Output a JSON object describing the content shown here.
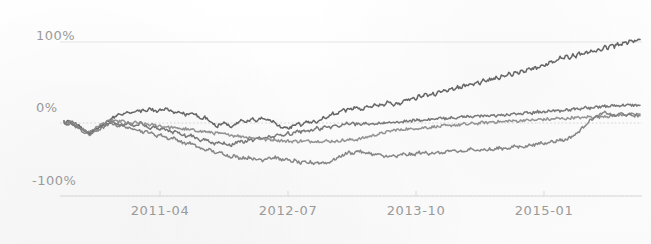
{
  "chart_data": {
    "type": "line",
    "title": "",
    "subtitle": "",
    "xlabel": "",
    "ylabel": "",
    "grid": true,
    "legend_position": "none",
    "ylim": [
      -100,
      100
    ],
    "ytick_labels": [
      "100%",
      "0%",
      "-100%"
    ],
    "ytick_values": [
      100,
      0,
      -100
    ],
    "xtick_labels": [
      "2011-04",
      "2012-07",
      "2013-10",
      "2015-01"
    ],
    "xtick_index": [
      30,
      70,
      110,
      150
    ],
    "x_count": 181,
    "x_domain_note": "monthly-like index from 2010-01 to 2015-04",
    "colors": {
      "series_1": "#595959",
      "series_2": "#6e6e6e",
      "series_3": "#8a8a8a",
      "series_4": "#7d7d7d",
      "gridline": "#e2e2e2",
      "zero_gridline": "#cfcfcf",
      "axis": "#d8d8d8",
      "tick_text": "#9a9a9a",
      "background": "#fdfdfd"
    },
    "series": [
      {
        "name": "series_1",
        "color": "#595959",
        "final_value": 103,
        "values": [
          2,
          1,
          3,
          0,
          -2,
          -4,
          -7,
          -10,
          -12,
          -9,
          -6,
          -4,
          -2,
          1,
          3,
          6,
          8,
          11,
          9,
          12,
          14,
          11,
          13,
          16,
          14,
          17,
          15,
          18,
          16,
          14,
          17,
          15,
          18,
          16,
          14,
          12,
          15,
          13,
          10,
          12,
          14,
          11,
          8,
          5,
          7,
          4,
          1,
          -2,
          -4,
          -1,
          1,
          -2,
          -5,
          -3,
          0,
          2,
          4,
          1,
          3,
          5,
          2,
          4,
          6,
          3,
          5,
          2,
          0,
          -3,
          -6,
          -4,
          -7,
          -5,
          -2,
          0,
          -3,
          -1,
          2,
          0,
          3,
          1,
          4,
          7,
          5,
          9,
          12,
          10,
          14,
          17,
          15,
          19,
          16,
          20,
          18,
          16,
          19,
          21,
          18,
          22,
          20,
          24,
          22,
          26,
          24,
          21,
          25,
          23,
          27,
          30,
          28,
          32,
          30,
          34,
          32,
          36,
          33,
          37,
          35,
          39,
          37,
          41,
          39,
          43,
          41,
          45,
          43,
          47,
          45,
          49,
          47,
          51,
          49,
          53,
          51,
          55,
          53,
          57,
          55,
          59,
          57,
          61,
          59,
          63,
          61,
          65,
          63,
          67,
          65,
          69,
          67,
          71,
          69,
          73,
          76,
          74,
          78,
          81,
          79,
          83,
          80,
          84,
          82,
          86,
          84,
          88,
          86,
          90,
          88,
          92,
          90,
          94,
          92,
          96,
          94,
          98,
          96,
          100,
          98,
          102,
          100,
          103,
          103
        ]
      },
      {
        "name": "series_2",
        "color": "#6e6e6e",
        "final_value": 22,
        "values": [
          0,
          -1,
          1,
          -2,
          -4,
          -6,
          -9,
          -11,
          -13,
          -10,
          -8,
          -6,
          -4,
          -2,
          0,
          2,
          0,
          -2,
          -4,
          -2,
          0,
          -2,
          -4,
          -2,
          0,
          -2,
          -4,
          -6,
          -4,
          -6,
          -8,
          -6,
          -8,
          -10,
          -12,
          -10,
          -12,
          -14,
          -16,
          -14,
          -16,
          -18,
          -20,
          -22,
          -20,
          -22,
          -24,
          -26,
          -24,
          -26,
          -24,
          -26,
          -28,
          -26,
          -24,
          -22,
          -24,
          -22,
          -20,
          -22,
          -20,
          -18,
          -20,
          -18,
          -16,
          -18,
          -16,
          -14,
          -16,
          -14,
          -12,
          -14,
          -12,
          -10,
          -12,
          -10,
          -8,
          -10,
          -8,
          -6,
          -8,
          -6,
          -4,
          -6,
          -4,
          -2,
          -4,
          -2,
          0,
          -2,
          0,
          -2,
          0,
          -2,
          0,
          -1,
          0,
          -1,
          0,
          -1,
          0,
          1,
          0,
          1,
          2,
          1,
          2,
          3,
          2,
          3,
          4,
          3,
          4,
          5,
          4,
          5,
          6,
          5,
          6,
          5,
          6,
          7,
          6,
          7,
          8,
          7,
          8,
          7,
          8,
          9,
          8,
          9,
          8,
          9,
          10,
          9,
          10,
          9,
          10,
          11,
          10,
          11,
          12,
          11,
          12,
          13,
          12,
          13,
          14,
          13,
          14,
          15,
          14,
          15,
          16,
          15,
          16,
          17,
          16,
          17,
          18,
          17,
          18,
          19,
          18,
          19,
          20,
          19,
          20,
          21,
          20,
          21,
          22,
          21,
          22,
          22,
          22,
          22,
          22,
          22,
          22
        ]
      },
      {
        "name": "series_3",
        "color": "#8a8a8a",
        "final_value": 11,
        "values": [
          1,
          0,
          2,
          -1,
          -3,
          -5,
          -8,
          -10,
          -11,
          -8,
          -6,
          -3,
          -1,
          1,
          2,
          4,
          2,
          1,
          3,
          1,
          0,
          -1,
          1,
          0,
          -1,
          -2,
          -1,
          -3,
          -2,
          -4,
          -3,
          -5,
          -4,
          -6,
          -5,
          -7,
          -6,
          -8,
          -7,
          -9,
          -8,
          -10,
          -9,
          -11,
          -10,
          -12,
          -11,
          -13,
          -12,
          -14,
          -13,
          -15,
          -14,
          -16,
          -15,
          -17,
          -16,
          -18,
          -17,
          -19,
          -18,
          -20,
          -19,
          -21,
          -20,
          -21,
          -20,
          -22,
          -21,
          -23,
          -22,
          -23,
          -22,
          -23,
          -22,
          -23,
          -22,
          -23,
          -22,
          -23,
          -22,
          -23,
          -22,
          -23,
          -22,
          -23,
          -22,
          -21,
          -22,
          -21,
          -20,
          -21,
          -20,
          -19,
          -18,
          -17,
          -16,
          -15,
          -14,
          -13,
          -12,
          -11,
          -10,
          -9,
          -8,
          -9,
          -8,
          -7,
          -8,
          -7,
          -6,
          -7,
          -6,
          -5,
          -6,
          -5,
          -4,
          -5,
          -4,
          -3,
          -4,
          -3,
          -2,
          -3,
          -2,
          -1,
          -2,
          -1,
          0,
          -1,
          0,
          1,
          0,
          1,
          2,
          1,
          2,
          1,
          2,
          3,
          2,
          3,
          2,
          3,
          4,
          3,
          4,
          3,
          4,
          5,
          4,
          5,
          4,
          5,
          6,
          5,
          6,
          5,
          6,
          7,
          6,
          7,
          6,
          7,
          8,
          7,
          8,
          7,
          8,
          9,
          8,
          9,
          10,
          9,
          10,
          11,
          10,
          11,
          10,
          11,
          11
        ]
      },
      {
        "name": "series_4",
        "color": "#7d7d7d",
        "final_value": 9,
        "values": [
          -1,
          -2,
          0,
          -3,
          -5,
          -8,
          -11,
          -13,
          -15,
          -12,
          -10,
          -8,
          -6,
          -4,
          -2,
          0,
          -2,
          -4,
          -2,
          -4,
          -6,
          -8,
          -6,
          -8,
          -10,
          -12,
          -10,
          -12,
          -14,
          -16,
          -14,
          -16,
          -18,
          -20,
          -18,
          -20,
          -22,
          -24,
          -26,
          -24,
          -26,
          -28,
          -30,
          -32,
          -34,
          -32,
          -34,
          -36,
          -38,
          -36,
          -38,
          -40,
          -42,
          -40,
          -42,
          -44,
          -42,
          -44,
          -42,
          -44,
          -46,
          -44,
          -46,
          -44,
          -42,
          -44,
          -42,
          -44,
          -46,
          -44,
          -46,
          -48,
          -46,
          -48,
          -50,
          -48,
          -50,
          -48,
          -50,
          -48,
          -50,
          -48,
          -50,
          -48,
          -46,
          -44,
          -42,
          -40,
          -38,
          -36,
          -38,
          -36,
          -34,
          -36,
          -38,
          -36,
          -38,
          -40,
          -38,
          -40,
          -42,
          -40,
          -42,
          -40,
          -42,
          -40,
          -38,
          -40,
          -38,
          -40,
          -38,
          -36,
          -38,
          -36,
          -38,
          -36,
          -38,
          -36,
          -38,
          -36,
          -34,
          -36,
          -34,
          -36,
          -34,
          -36,
          -34,
          -32,
          -34,
          -32,
          -34,
          -32,
          -34,
          -32,
          -34,
          -32,
          -30,
          -32,
          -30,
          -32,
          -30,
          -28,
          -30,
          -28,
          -30,
          -28,
          -26,
          -28,
          -26,
          -24,
          -26,
          -24,
          -22,
          -24,
          -22,
          -20,
          -22,
          -20,
          -18,
          -16,
          -14,
          -10,
          -6,
          -2,
          2,
          5,
          7,
          9,
          11,
          13,
          12,
          10,
          8,
          10,
          12,
          11,
          9,
          10,
          9,
          9,
          9
        ]
      }
    ]
  }
}
